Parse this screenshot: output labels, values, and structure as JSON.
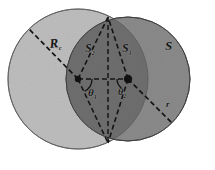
{
  "figure": {
    "background_color": "#ffffff",
    "labels": {
      "radius_big": "R",
      "radius_big_sub": "c",
      "area_left_lens": "S",
      "area_left_lens_sub": "2",
      "area_right_lens": "S",
      "area_right_lens_sub": "1",
      "area_outer": "S",
      "angle_left": "θ",
      "angle_left_sub": "1",
      "angle_right": "θ",
      "angle_right_sub": "2",
      "radius_small": "r"
    },
    "colors": {
      "left_circle_fill": "#bdbdbd",
      "right_circle_fill": "#8a8a8a",
      "overlap_fill": "#6f6f6f",
      "outline": "#3c3c3c",
      "dash_line": "#1a1a1a",
      "vertex_dot": "#111111",
      "label_text": "#161616",
      "page_background": "#ffffff"
    },
    "geometry": {
      "left_circle": {
        "cx": 78,
        "cy": 79,
        "r": 70
      },
      "right_circle": {
        "cx": 128,
        "cy": 79,
        "r": 62
      },
      "left_center_vertex": {
        "x": 78,
        "y": 79
      },
      "right_center_vertex": {
        "x": 128,
        "y": 79
      },
      "top_intersection": {
        "x": 108,
        "y": 17
      },
      "bottom_intersection": {
        "x": 108,
        "y": 143
      },
      "dash_pattern": "5 3",
      "angle_arc_radius": 13
    }
  }
}
